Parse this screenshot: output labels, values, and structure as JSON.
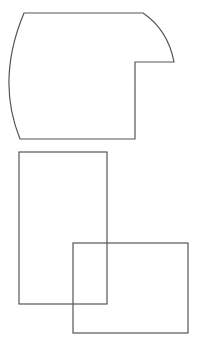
{
  "diagram": {
    "background": "#ffffff",
    "stroke_color": "#555555",
    "shapes": [
      {
        "id": "notched-rounded-shape",
        "type": "path",
        "description": "shape with curved left side, rounded top-right corner and rectangular notch at right"
      },
      {
        "id": "tall-rectangle",
        "type": "rect",
        "x": 19,
        "y": 152,
        "width": 88,
        "height": 152
      },
      {
        "id": "wide-rectangle",
        "type": "rect",
        "x": 73,
        "y": 243,
        "width": 115,
        "height": 90
      }
    ]
  }
}
